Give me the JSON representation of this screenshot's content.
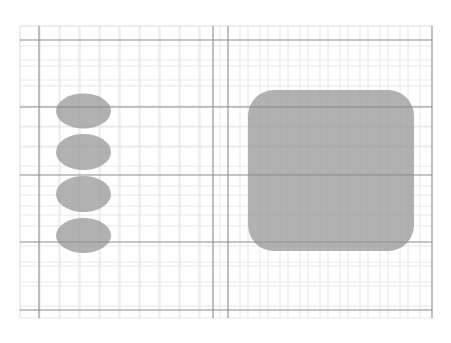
{
  "canvas": {
    "width": 451,
    "height": 343,
    "background_color": "#ffffff",
    "title": "Grid Canvas Shapes"
  },
  "grid": {
    "minor_line_color": "#e2e2e6",
    "major_line_color": "#8b8b92",
    "minor_spacing": 20,
    "minor_line_width": 0.8,
    "major_line_width": 1.1,
    "area": {
      "x": 20,
      "y": 26,
      "width": 412,
      "height": 292
    },
    "major_vertical_x": [
      39,
      213,
      228,
      432
    ],
    "major_horizontal_y": [
      40,
      107,
      175,
      242,
      310
    ],
    "minor_vertical_x": [
      20,
      59,
      79,
      99,
      119,
      139,
      159,
      179,
      199,
      248,
      268,
      288,
      308,
      328,
      348,
      368,
      388,
      408
    ],
    "minor_horizontal_y": [
      26,
      60,
      80,
      127,
      147,
      195,
      215,
      262,
      282,
      318
    ]
  },
  "shapes": {
    "fill_color": "#9b9b9b",
    "fill_opacity": 0.78,
    "ellipses": [
      {
        "label": "ellipse-1",
        "cx": 83.5,
        "cy": 111,
        "rx": 27.5,
        "ry": 17.5
      },
      {
        "label": "ellipse-2",
        "cx": 83.5,
        "cy": 152,
        "rx": 27.5,
        "ry": 18
      },
      {
        "label": "ellipse-3",
        "cx": 83.5,
        "cy": 194,
        "rx": 27.5,
        "ry": 18
      },
      {
        "label": "ellipse-4",
        "cx": 83.5,
        "cy": 235.5,
        "rx": 27.5,
        "ry": 17.5
      }
    ],
    "rounded_rect": {
      "label": "rounded-rect-1",
      "x": 248,
      "y": 90,
      "width": 166,
      "height": 161,
      "corner_radius": 26
    }
  }
}
